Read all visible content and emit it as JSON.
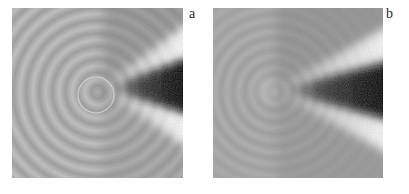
{
  "figure": {
    "background": "#ffffff",
    "panels": [
      {
        "label": "a",
        "content": "ripple-wave-pattern-with-mach-cone-and-circled-source"
      },
      {
        "label": "b",
        "content": "ripple-wave-pattern-with-mach-cone"
      }
    ],
    "colors": {
      "base_gray": "#a9a9a9",
      "ripple_crest": "#c0c0c0",
      "ripple_trough": "#9b9b9b",
      "cone_black": "#060606",
      "band_white": "#fbfbfb",
      "annotation_circle": "#d9d9d9",
      "label_text": "#262626"
    }
  }
}
